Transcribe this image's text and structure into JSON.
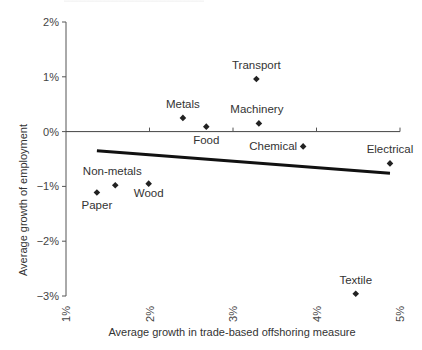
{
  "chart_data": {
    "type": "scatter",
    "title": "",
    "xlabel": "Average growth in trade-based offshoring measure",
    "ylabel": "Average growth of employment",
    "xlim": [
      1,
      5
    ],
    "ylim": [
      -3,
      2
    ],
    "x_ticks": [
      "1%",
      "2%",
      "3%",
      "4%",
      "5%"
    ],
    "y_ticks": [
      "2%",
      "1%",
      "0%",
      "−1%",
      "−2%",
      "−3%"
    ],
    "grid": false,
    "legend": null,
    "series": [
      {
        "name": "Industries",
        "marker": "diamond",
        "color": "#222222",
        "points": [
          {
            "label": "Paper",
            "x": 1.37,
            "y": -1.11
          },
          {
            "label": "Non-metals",
            "x": 1.59,
            "y": -0.98
          },
          {
            "label": "Wood",
            "x": 1.99,
            "y": -0.95
          },
          {
            "label": "Metals",
            "x": 2.4,
            "y": 0.25
          },
          {
            "label": "Food",
            "x": 2.68,
            "y": 0.09
          },
          {
            "label": "Transport",
            "x": 3.28,
            "y": 0.96
          },
          {
            "label": "Machinery",
            "x": 3.31,
            "y": 0.15
          },
          {
            "label": "Chemical",
            "x": 3.84,
            "y": -0.27
          },
          {
            "label": "Textile",
            "x": 4.47,
            "y": -2.96
          },
          {
            "label": "Electrical",
            "x": 4.88,
            "y": -0.58
          }
        ]
      }
    ],
    "trend_line": {
      "type": "linear fit",
      "color": "#111111",
      "start": {
        "x": 1.37,
        "y": -0.35
      },
      "end": {
        "x": 4.88,
        "y": -0.76
      }
    }
  }
}
